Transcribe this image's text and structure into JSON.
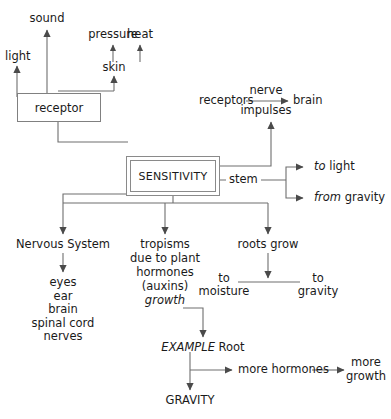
{
  "diagram": {
    "line_color": "#6e6e6e",
    "text_color": "#1a1a1a",
    "box_border_color": "#808080"
  },
  "stimuli": {
    "light": "light",
    "sound": "sound",
    "pressure": "pressure",
    "heat": "heat",
    "skin": "skin"
  },
  "nodes": {
    "receptor": "receptor",
    "sensitivity": "SENSITIVITY",
    "stem": "stem",
    "receptors": "receptors",
    "nerve": "nerve",
    "impulses": "impulses",
    "brain": "brain"
  },
  "stem_outputs": {
    "to_light_em": "to",
    "to_light_rest": "light",
    "from_gravity_em": "from",
    "from_gravity_rest": "gravity"
  },
  "branches": {
    "nervous_system": "Nervous System",
    "nervous_parts": "eyes\near\nbrain\nspinal cord\nnerves",
    "tropisms_line1": "tropisms",
    "tropisms_line2": "due to plant",
    "tropisms_line3": "hormones",
    "tropisms_line4": "(auxins)",
    "tropisms_growth": "growth",
    "roots_grow": "roots grow",
    "to_moisture_l1": "to",
    "to_moisture_l2": "moisture",
    "to_gravity_l1": "to",
    "to_gravity_l2": "gravity"
  },
  "example": {
    "word_em": "EXAMPLE",
    "word_rest": "Root",
    "gravity": "GRAVITY",
    "more_hormones": "more hormones",
    "more_growth_l1": "more",
    "more_growth_l2": "growth"
  }
}
